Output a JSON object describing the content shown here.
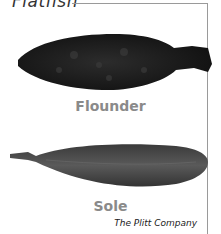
{
  "title": "Flatfish",
  "fish": [
    {
      "name": "Flounder",
      "color": "#1e1e1e"
    },
    {
      "name": "Sole",
      "color": "#4a4a4a"
    }
  ],
  "credit": "The Plitt Company",
  "frame_color": "#9a9a9a"
}
